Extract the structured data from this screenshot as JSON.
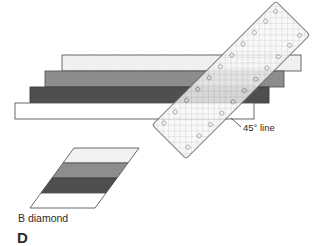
{
  "figure": {
    "panel_label": "D",
    "annotations": {
      "angle_line": "45° line",
      "diamond": "B diamond"
    },
    "colors": {
      "outline": "#5a5a5a",
      "text": "#2b2b2b",
      "background": "#ffffff",
      "strip_light": "#f1f1f1",
      "strip_medium": "#8d8d8d",
      "strip_dark": "#4f4f4f",
      "strip_white": "#ffffff",
      "ruler_fill": "#f6f6f6",
      "ruler_grid": "#c9c9c9",
      "ruler_edge": "#6e6e6e"
    },
    "strip_set": {
      "name": "stacked-fabric-strips",
      "description": "Four sewn fabric strips stacked and offset into a stepped stair pattern",
      "strips": [
        {
          "index": 1,
          "shade": "light",
          "fill": "#f1f1f1",
          "left": 62,
          "top": 55,
          "width": 239,
          "height": 16
        },
        {
          "index": 2,
          "shade": "medium",
          "fill": "#8d8d8d",
          "left": 45,
          "top": 71,
          "width": 239,
          "height": 16
        },
        {
          "index": 3,
          "shade": "dark",
          "fill": "#4f4f4f",
          "left": 30,
          "top": 87,
          "width": 239,
          "height": 16
        },
        {
          "index": 4,
          "shade": "white",
          "fill": "#ffffff",
          "left": 15,
          "top": 103,
          "width": 239,
          "height": 16
        }
      ]
    },
    "ruler": {
      "name": "quilting-ruler",
      "rotation_degrees": -45,
      "length": 175,
      "width": 48,
      "center_x": 231,
      "center_y": 80
    },
    "diamond": {
      "name": "b-diamond-unit",
      "skew_degrees": 45,
      "bands": [
        {
          "index": 1,
          "shade": "light",
          "fill": "#f1f1f1"
        },
        {
          "index": 2,
          "shade": "medium",
          "fill": "#8d8d8d"
        },
        {
          "index": 3,
          "shade": "dark",
          "fill": "#4f4f4f"
        },
        {
          "index": 4,
          "shade": "white",
          "fill": "#ffffff"
        }
      ]
    }
  }
}
